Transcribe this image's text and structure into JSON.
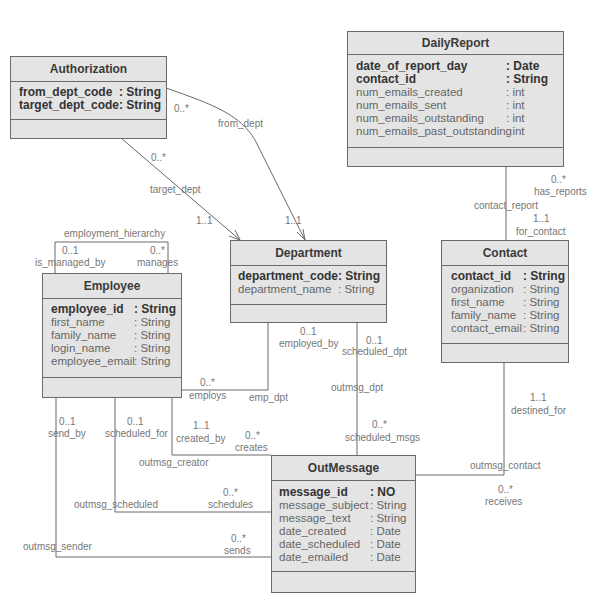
{
  "classes": {
    "authorization": {
      "name": "Authorization",
      "attributes": [
        {
          "name": "from_dept_code",
          "type": ": String",
          "key": true
        },
        {
          "name": "target_dept_code",
          "type": ": String",
          "key": true
        }
      ]
    },
    "daily_report": {
      "name": "DailyReport",
      "attributes": [
        {
          "name": "date_of_report_day",
          "type": ": Date",
          "key": true
        },
        {
          "name": "contact_id",
          "type": ": String",
          "key": true
        },
        {
          "name": "num_emails_created",
          "type": ": int",
          "key": false
        },
        {
          "name": "num_emails_sent",
          "type": ": int",
          "key": false
        },
        {
          "name": "num_emails_outstanding",
          "type": ": int",
          "key": false
        },
        {
          "name": "num_emails_past_outstanding",
          "type": ": int",
          "key": false
        }
      ]
    },
    "department": {
      "name": "Department",
      "attributes": [
        {
          "name": "department_code",
          "type": ": String",
          "key": true
        },
        {
          "name": "department_name",
          "type": ": String",
          "key": false
        }
      ]
    },
    "contact": {
      "name": "Contact",
      "attributes": [
        {
          "name": "contact_id",
          "type": ": String",
          "key": true
        },
        {
          "name": "organization",
          "type": ": String",
          "key": false
        },
        {
          "name": "first_name",
          "type": ": String",
          "key": false
        },
        {
          "name": "family_name",
          "type": ": String",
          "key": false
        },
        {
          "name": "contact_email",
          "type": ": String",
          "key": false
        }
      ]
    },
    "employee": {
      "name": "Employee",
      "attributes": [
        {
          "name": "employee_id",
          "type": ": String",
          "key": true
        },
        {
          "name": "first_name",
          "type": ": String",
          "key": false
        },
        {
          "name": "family_name",
          "type": ": String",
          "key": false
        },
        {
          "name": "login_name",
          "type": ": String",
          "key": false
        },
        {
          "name": "employee_email",
          "type": ": String",
          "key": false
        }
      ]
    },
    "out_message": {
      "name": "OutMessage",
      "attributes": [
        {
          "name": "message_id",
          "type": ": NO",
          "key": true
        },
        {
          "name": "message_subject",
          "type": ": String",
          "key": false
        },
        {
          "name": "message_text",
          "type": ": String",
          "key": false
        },
        {
          "name": "date_created",
          "type": ": Date",
          "key": false
        },
        {
          "name": "date_scheduled",
          "type": ": Date",
          "key": false
        },
        {
          "name": "date_emailed",
          "type": ": Date",
          "key": false
        }
      ]
    }
  },
  "labels": {
    "auth_from_mult": "0..*",
    "from_dept": "from_dept",
    "auth_target_mult": "0..*",
    "target_dept": "target_dept",
    "dept_target_mult": "1..1",
    "dept_from_mult": "1..1",
    "employment_hierarchy": "employment_hierarchy",
    "is_managed_by_mult": "0..1",
    "is_managed_by": "is_managed_by",
    "manages_mult": "0..*",
    "manages": "manages",
    "has_reports_mult": "0..*",
    "has_reports": "has_reports",
    "contact_report": "contact_report",
    "for_contact_mult": "1..1",
    "for_contact": "for_contact",
    "employed_by_mult": "0..1",
    "employed_by": "employed_by",
    "employs_mult": "0..*",
    "employs": "employs",
    "emp_dpt": "emp_dpt",
    "scheduled_dpt_mult": "0..1",
    "scheduled_dpt": "scheduled_dpt",
    "outmsg_dpt": "outmsg_dpt",
    "scheduled_msgs_mult": "0..*",
    "scheduled_msgs": "scheduled_msgs",
    "destined_for_mult": "1..1",
    "destined_for": "destined_for",
    "outmsg_contact": "outmsg_contact",
    "receives_mult": "0..*",
    "receives": "receives",
    "send_by_mult": "0..1",
    "send_by": "send_by",
    "scheduled_for_mult": "0..1",
    "scheduled_for": "scheduled_for",
    "created_by_mult": "1..1",
    "created_by": "created_by",
    "creates_mult": "0..*",
    "creates": "creates",
    "outmsg_creator": "outmsg_creator",
    "outmsg_scheduled": "outmsg_scheduled",
    "schedules_mult": "0..*",
    "schedules": "schedules",
    "outmsg_sender": "outmsg_sender",
    "sends_mult": "0..*",
    "sends": "sends"
  },
  "colors": {
    "box_fill": "#e4e4e4",
    "box_border": "#6a6a6a",
    "line": "#6a6a6a",
    "label_text": "#777777"
  }
}
